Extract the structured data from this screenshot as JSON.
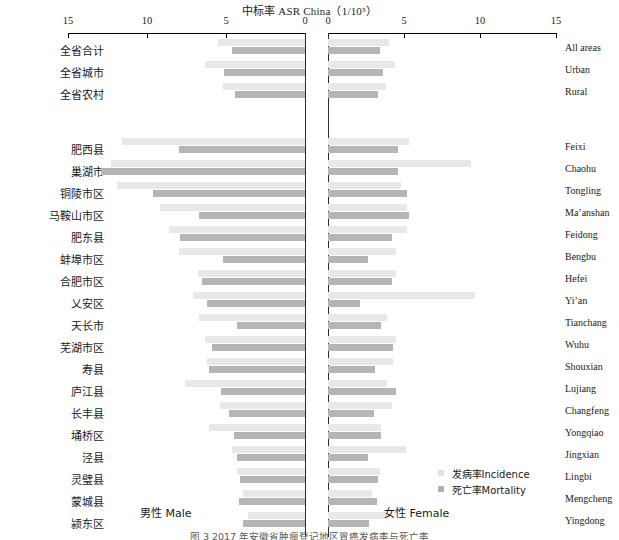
{
  "chart_data": {
    "type": "bar",
    "subtype": "population-pyramid-diverging-bar",
    "title": "中标率 ASR China（1/10⁵）",
    "title_plain": "ASR China (1/10^5)",
    "xlabel_left": "男性 Male",
    "xlabel_right": "女性 Female",
    "ylabel": "",
    "grid": false,
    "legend_position": "bottom-right",
    "axis": {
      "left_ticks": [
        15,
        10,
        5,
        0
      ],
      "right_ticks": [
        0,
        5,
        10,
        15
      ],
      "left_xlim": [
        15,
        0
      ],
      "right_xlim": [
        0,
        15
      ],
      "units": "per 100,000"
    },
    "legend": [
      {
        "key": "incidence",
        "label": "发病率Incidence",
        "color": "#e2e2e2"
      },
      {
        "key": "mortality",
        "label": "死亡率Mortality",
        "color": "#b0b0b0"
      }
    ],
    "series": [
      {
        "name": "发病率Incidence",
        "key": "incidence",
        "color": "#e8e8e8"
      },
      {
        "name": "死亡率Mortality",
        "key": "mortality",
        "color": "#b5b5b5"
      }
    ],
    "groups": [
      {
        "id": "summary",
        "rows": [
          {
            "cn": "全省合计",
            "en": "All areas",
            "male_incidence": 5.5,
            "male_mortality": 4.6,
            "female_incidence": 4.0,
            "female_mortality": 3.4
          },
          {
            "cn": "全省城市",
            "en": "Urban",
            "male_incidence": 6.3,
            "male_mortality": 5.1,
            "female_incidence": 4.4,
            "female_mortality": 3.6
          },
          {
            "cn": "全省农村",
            "en": "Rural",
            "male_incidence": 5.2,
            "male_mortality": 4.4,
            "female_incidence": 3.8,
            "female_mortality": 3.3
          }
        ]
      },
      {
        "id": "counties",
        "rows": [
          {
            "cn": "肥西县",
            "en": "Feixi",
            "male_incidence": 11.6,
            "male_mortality": 8.0,
            "female_incidence": 5.3,
            "female_mortality": 4.6
          },
          {
            "cn": "巢湖市",
            "en": "Chaohu",
            "male_incidence": 12.3,
            "male_mortality": 12.9,
            "female_incidence": 9.4,
            "female_mortality": 4.6
          },
          {
            "cn": "铜陵市区",
            "en": "Tongling",
            "male_incidence": 11.9,
            "male_mortality": 9.6,
            "female_incidence": 4.8,
            "female_mortality": 5.2
          },
          {
            "cn": "马鞍山市区",
            "en": "Ma’anshan",
            "male_incidence": 9.2,
            "male_mortality": 6.7,
            "female_incidence": 5.2,
            "female_mortality": 5.3
          },
          {
            "cn": "肥东县",
            "en": "Feidong",
            "male_incidence": 8.6,
            "male_mortality": 7.9,
            "female_incidence": 5.2,
            "female_mortality": 4.2
          },
          {
            "cn": "蚌埠市区",
            "en": "Bengbu",
            "male_incidence": 8.0,
            "male_mortality": 5.2,
            "female_incidence": 4.5,
            "female_mortality": 2.6
          },
          {
            "cn": "合肥市区",
            "en": "Hefei",
            "male_incidence": 6.8,
            "male_mortality": 6.5,
            "female_incidence": 4.5,
            "female_mortality": 4.2
          },
          {
            "cn": "乂安区",
            "en": "Yi’an",
            "male_incidence": 7.1,
            "male_mortality": 6.2,
            "female_incidence": 9.7,
            "female_mortality": 2.1
          },
          {
            "cn": "天长市",
            "en": "Tianchang",
            "male_incidence": 6.7,
            "male_mortality": 4.3,
            "female_incidence": 3.9,
            "female_mortality": 3.5
          },
          {
            "cn": "芜湖市区",
            "en": "Wuhu",
            "male_incidence": 6.3,
            "male_mortality": 5.9,
            "female_incidence": 4.5,
            "female_mortality": 4.3
          },
          {
            "cn": "寿县",
            "en": "Shouxian",
            "male_incidence": 6.2,
            "male_mortality": 6.1,
            "female_incidence": 4.3,
            "female_mortality": 3.1
          },
          {
            "cn": "庐江县",
            "en": "Lujiang",
            "male_incidence": 7.6,
            "male_mortality": 5.3,
            "female_incidence": 3.9,
            "female_mortality": 4.5
          },
          {
            "cn": "长丰县",
            "en": "Changfeng",
            "male_incidence": 5.4,
            "male_mortality": 4.8,
            "female_incidence": 4.2,
            "female_mortality": 3.0
          },
          {
            "cn": "埇桥区",
            "en": "Yongqiao",
            "male_incidence": 6.1,
            "male_mortality": 4.5,
            "female_incidence": 3.5,
            "female_mortality": 3.5
          },
          {
            "cn": "泾县",
            "en": "Jingxian",
            "male_incidence": 4.6,
            "male_mortality": 4.3,
            "female_incidence": 5.1,
            "female_mortality": 2.6
          },
          {
            "cn": "灵璧县",
            "en": "Lingbi",
            "male_incidence": 4.3,
            "male_mortality": 4.1,
            "female_incidence": 3.4,
            "female_mortality": 3.3
          },
          {
            "cn": "蒙城县",
            "en": "Mengcheng",
            "male_incidence": 3.9,
            "male_mortality": 4.2,
            "female_incidence": 2.9,
            "female_mortality": 3.2
          },
          {
            "cn": "颍东区",
            "en": "Yingdong",
            "male_incidence": 3.6,
            "male_mortality": 3.9,
            "female_incidence": 3.9,
            "female_mortality": 2.7
          }
        ]
      }
    ]
  },
  "caption": "图 3 2017 年安徽省肿瘤登记地区胃癌发病率与死亡率"
}
